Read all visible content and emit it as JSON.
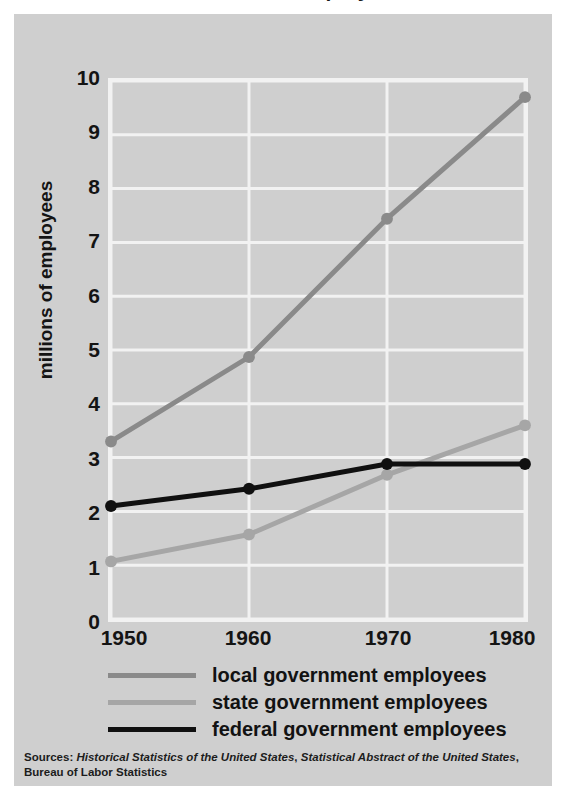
{
  "chart_data": {
    "type": "line",
    "title": "Government Employees",
    "xlabel": "",
    "ylabel": "millions of employees",
    "x": [
      1950,
      1960,
      1970,
      1980
    ],
    "xtick_labels": [
      "1950",
      "1960",
      "1970",
      "1980"
    ],
    "ytick_labels": [
      "0",
      "1",
      "2",
      "3",
      "4",
      "5",
      "6",
      "7",
      "8",
      "9",
      "10"
    ],
    "ylim": [
      0,
      10
    ],
    "xlim": [
      1950,
      1980
    ],
    "grid": true,
    "grid_color": "#f2f2f2",
    "plot_background": "#cfcfcf",
    "legend_position": "below-plot",
    "series": [
      {
        "name": "local government employees",
        "color": "#8a8a8a",
        "values": [
          3.3,
          4.87,
          7.44,
          9.7
        ]
      },
      {
        "name": "state government employees",
        "color": "#a6a6a6",
        "values": [
          1.07,
          1.57,
          2.68,
          3.6
        ]
      },
      {
        "name": "federal government employees",
        "color": "#101010",
        "values": [
          2.1,
          2.42,
          2.88,
          2.88
        ]
      }
    ]
  },
  "source_note": {
    "prefix": "Sources: ",
    "italic_one": "Historical Statistics of the United States",
    "separator_one": ", ",
    "italic_two": "Statistical Abstract of the United States",
    "separator_two": ",",
    "line_two": "Bureau of Labor Statistics"
  }
}
